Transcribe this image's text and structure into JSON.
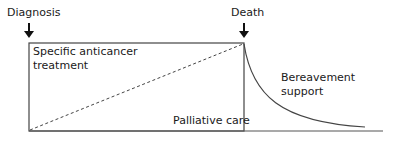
{
  "diagram": {
    "type": "care-continuum",
    "labels": {
      "diagnosis": "Diagnosis",
      "death": "Death",
      "anticancer_line1": "Specific anticancer",
      "anticancer_line2": "treatment",
      "palliative": "Palliative care",
      "bereavement_line1": "Bereavement",
      "bereavement_line2": "support"
    },
    "colors": {
      "line": "#333333",
      "text": "#1a1a1a",
      "background": "#ffffff"
    }
  }
}
